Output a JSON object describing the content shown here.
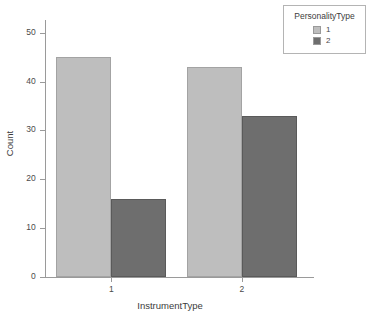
{
  "chart_data": {
    "type": "bar",
    "title": "",
    "subtitle": "",
    "xlabel": "InstrumentType",
    "ylabel": "Count",
    "categories": [
      "1",
      "2"
    ],
    "series": [
      {
        "name": "1",
        "values": [
          45,
          43
        ],
        "color": "#bebebe"
      },
      {
        "name": "2",
        "values": [
          16,
          33
        ],
        "color": "#6e6e6e"
      }
    ],
    "ylim": [
      0,
      52
    ],
    "yticks": [
      0,
      10,
      20,
      30,
      40,
      50
    ],
    "ytick_labels": [
      "0",
      "10",
      "20",
      "30",
      "40",
      "50"
    ],
    "xtick_labels": [
      "1",
      "2"
    ],
    "grid": false,
    "legend": {
      "title": "PersonalityType",
      "position": "top-right",
      "entries": [
        {
          "label": "1",
          "color": "#bebebe"
        },
        {
          "label": "2",
          "color": "#6e6e6e"
        }
      ]
    },
    "bar_mode": "grouped",
    "background": "#ffffff",
    "axis_color": "#9a9a9a",
    "text_color": "#3c3c3c"
  }
}
